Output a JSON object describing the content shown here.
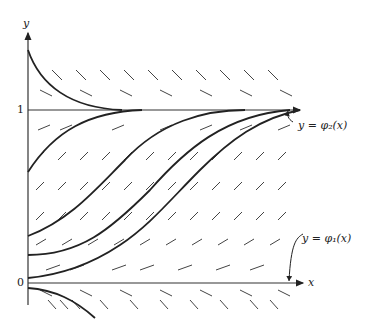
{
  "figure": {
    "axes": {
      "x_label": "x",
      "y_label": "y",
      "y_ticks": [
        {
          "value": 0,
          "label": "0"
        },
        {
          "value": 1,
          "label": "1"
        }
      ]
    },
    "annotations": {
      "phi2": "y = φ₂(x)",
      "phi1": "y = φ₁(x)"
    },
    "colors": {
      "ink": "#222222",
      "field": "#444444",
      "background": "#ffffff"
    }
  }
}
